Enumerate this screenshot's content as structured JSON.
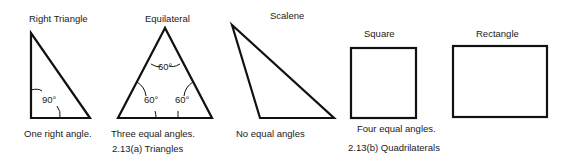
{
  "titles": {
    "right": "Right Triangle",
    "equilateral": "Equilateral",
    "scalene": "Scalene",
    "square": "Square",
    "rectangle": "Rectangle"
  },
  "angles": {
    "right": "90°",
    "eq_top": "60°",
    "eq_left": "60°",
    "eq_right": "60°"
  },
  "descriptions": {
    "right": "One right angle.",
    "equilateral": "Three equal angles.",
    "scalene": "No equal angles",
    "quadrilaterals": "Four equal angles."
  },
  "captions": {
    "triangles": "2.13(a) Triangles",
    "quadrilaterals": "2.13(b) Quadrilaterals"
  },
  "colors": {
    "stroke": "#111111",
    "text": "#1a1a1a",
    "background": "#ffffff"
  }
}
